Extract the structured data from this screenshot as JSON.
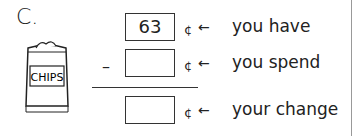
{
  "problem": {
    "label": "C."
  },
  "image": {
    "name": "chips-bag",
    "text": "CHIPS"
  },
  "rows": [
    {
      "value": "63",
      "unit": "¢",
      "arrow": "←",
      "description": "you have"
    },
    {
      "value": "",
      "unit": "¢",
      "arrow": "←",
      "description": "you spend",
      "operator": "–"
    },
    {
      "value": "",
      "unit": "¢",
      "arrow": "←",
      "description": "your change"
    }
  ]
}
